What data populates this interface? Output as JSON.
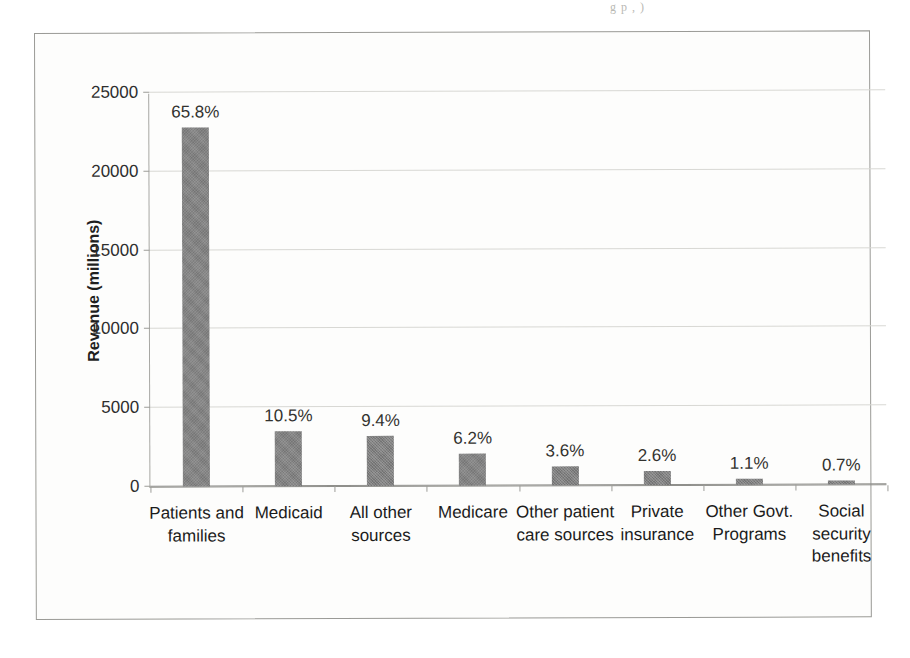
{
  "page": {
    "top_fragment": "g  p  , )"
  },
  "chart_data": {
    "type": "bar",
    "title": "",
    "xlabel": "",
    "ylabel": "Revenue (millions)",
    "ylim": [
      0,
      25000
    ],
    "ytick_labels": [
      "0",
      "5000",
      "10000",
      "15000",
      "20000",
      "25000"
    ],
    "yticks": [
      0,
      5000,
      10000,
      15000,
      20000,
      25000
    ],
    "grid": true,
    "legend": "none",
    "bar_color": "#808080",
    "categories": [
      "Patients and families",
      "Medicaid",
      "All other sources",
      "Medicare",
      "Other patient care sources",
      "Private insurance",
      "Other Govt. Programs",
      "Social security benefits"
    ],
    "values": [
      22800,
      3500,
      3150,
      2050,
      1200,
      880,
      370,
      240
    ],
    "data_labels": [
      "65.8%",
      "10.5%",
      "9.4%",
      "6.2%",
      "3.6%",
      "2.6%",
      "1.1%",
      "0.7%"
    ],
    "percentages": [
      65.8,
      10.5,
      9.4,
      6.2,
      3.6,
      2.6,
      1.1,
      0.7
    ]
  }
}
